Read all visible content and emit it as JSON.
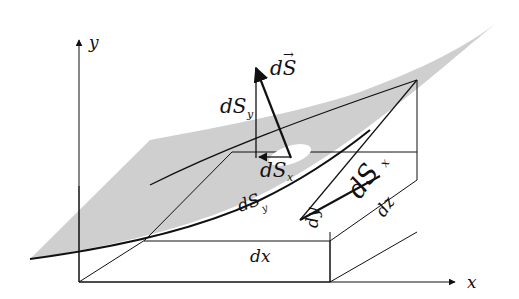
{
  "figure": {
    "colors": {
      "surface_fill": "#cfcfcf",
      "lines": "#111111",
      "background": "#ffffff"
    },
    "axes": {
      "x_label": "x",
      "y_label": "y"
    },
    "vectors": {
      "dS_label_main": "dS",
      "dS_arrow_mark": "→",
      "dSy_main": "dS",
      "dSy_sub": "y",
      "dSx_main": "dS",
      "dSx_sub": "x"
    },
    "box_labels": {
      "dx": "dx",
      "dy": "dy",
      "dz": "dz",
      "dSx_face_main": "dS",
      "dSx_face_sub": "x",
      "dSy_face_main": "dS",
      "dSy_face_sub": "y"
    }
  }
}
